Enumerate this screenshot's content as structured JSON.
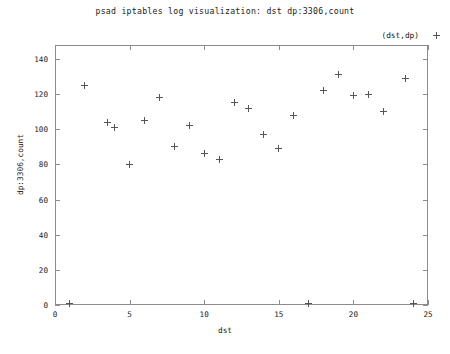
{
  "chart_data": {
    "type": "scatter",
    "title": "psad iptables log visualization: dst dp:3306,count",
    "xlabel": "dst",
    "ylabel": "dp:3306,count",
    "xlim": [
      0,
      25
    ],
    "ylim": [
      0,
      148
    ],
    "xticks": [
      0,
      5,
      10,
      15,
      20,
      25
    ],
    "yticks": [
      0,
      20,
      40,
      60,
      80,
      100,
      120,
      140
    ],
    "grid": false,
    "legend_position": "top-right",
    "marker": "+",
    "marker_color": "#555555",
    "series": [
      {
        "name": "(dst,dp)",
        "points": [
          {
            "x": 1,
            "y": 1
          },
          {
            "x": 2,
            "y": 125
          },
          {
            "x": 3.5,
            "y": 104
          },
          {
            "x": 4,
            "y": 101
          },
          {
            "x": 5,
            "y": 80
          },
          {
            "x": 6,
            "y": 105
          },
          {
            "x": 7,
            "y": 118
          },
          {
            "x": 8,
            "y": 90
          },
          {
            "x": 9,
            "y": 102
          },
          {
            "x": 10,
            "y": 86
          },
          {
            "x": 11,
            "y": 83
          },
          {
            "x": 12,
            "y": 115
          },
          {
            "x": 13,
            "y": 112
          },
          {
            "x": 14,
            "y": 97
          },
          {
            "x": 15,
            "y": 89
          },
          {
            "x": 16,
            "y": 108
          },
          {
            "x": 17,
            "y": 1
          },
          {
            "x": 18,
            "y": 122
          },
          {
            "x": 19,
            "y": 131
          },
          {
            "x": 20,
            "y": 119
          },
          {
            "x": 21,
            "y": 120
          },
          {
            "x": 22,
            "y": 110
          },
          {
            "x": 23.5,
            "y": 129
          },
          {
            "x": 24,
            "y": 1
          }
        ]
      }
    ]
  },
  "legend": {
    "entry_label": "(dst,dp)",
    "marker_glyph": "+"
  },
  "footer": {
    "text": ""
  }
}
